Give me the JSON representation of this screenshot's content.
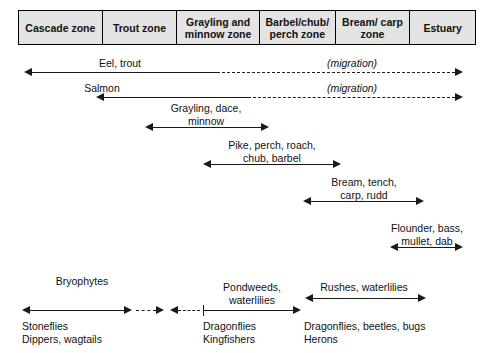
{
  "diagram": {
    "zones": [
      {
        "id": "cascade",
        "label": "Cascade\nzone"
      },
      {
        "id": "trout",
        "label": "Trout\nzone"
      },
      {
        "id": "grayling",
        "label": "Grayling and\nminnow zone"
      },
      {
        "id": "barbel",
        "label": "Barbel/chub/\nperch zone"
      },
      {
        "id": "bream",
        "label": "Bream/\ncarp zone"
      },
      {
        "id": "estuary",
        "label": "Estuary"
      }
    ],
    "bands": [
      {
        "id": "eel-trout",
        "label": "Eel, trout",
        "note": "(migration)"
      },
      {
        "id": "salmon",
        "label": "Salmon",
        "note": "(migration)"
      },
      {
        "id": "grayling-dace",
        "label": "Grayling, dace,\nminnow",
        "note": ""
      },
      {
        "id": "pike-perch",
        "label": "Pike, perch, roach,\nchub, barbel",
        "note": ""
      },
      {
        "id": "bream-tench",
        "label": "Bream, tench,\ncarp, rudd",
        "note": ""
      },
      {
        "id": "flounder",
        "label": "Flounder, bass,\nmullet, dab",
        "note": ""
      }
    ],
    "plants": [
      {
        "id": "bryophytes",
        "label": "Bryophytes"
      },
      {
        "id": "pondweeds",
        "label": "Pondweeds,\nwaterlilies"
      },
      {
        "id": "rushes",
        "label": "Rushes, waterlilies"
      }
    ],
    "fauna": [
      {
        "id": "stoneflies",
        "label": "Stoneflies\nDippers, wagtails"
      },
      {
        "id": "dragonflies",
        "label": "Dragonflies\nKingfishers"
      },
      {
        "id": "herons",
        "label": "Dragonflies, beetles, bugs\nHerons"
      }
    ],
    "colors": {
      "header_fill": "#e3e3e3",
      "line": "#1a1a1a",
      "text": "#111111",
      "background": "#ffffff"
    }
  }
}
